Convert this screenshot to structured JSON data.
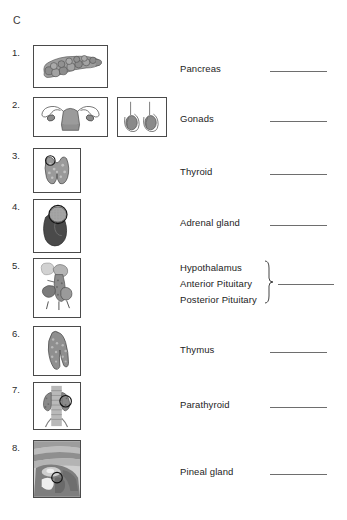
{
  "worksheet": {
    "section_letter": "C",
    "answer_line_color": "#6e6e6e",
    "box_border_color": "#4a4a4a",
    "text_color": "#1d1d1d"
  },
  "rows": [
    {
      "number": "1.",
      "label": "Pancreas",
      "figure": "pancreas-illustration",
      "figures": [
        "pancreas-illustration"
      ]
    },
    {
      "number": "2.",
      "label": "Gonads",
      "figure": "uterus-ovaries-illustration",
      "figures": [
        "uterus-ovaries-illustration",
        "testes-illustration"
      ]
    },
    {
      "number": "3.",
      "label": "Thyroid",
      "figure": "thyroid-gland-illustration",
      "figures": [
        "thyroid-gland-illustration"
      ]
    },
    {
      "number": "4.",
      "label": "Adrenal gland",
      "figure": "kidney-adrenal-illustration",
      "figures": [
        "kidney-adrenal-illustration"
      ]
    },
    {
      "number": "5.",
      "label": "Hypothalamus",
      "label_2": "Anterior Pituitary",
      "label_3": "Posterior Pituitary",
      "grouped": true,
      "figure": "hypothalamus-pituitary-illustration",
      "figures": [
        "hypothalamus-pituitary-illustration"
      ]
    },
    {
      "number": "6.",
      "label": "Thymus",
      "figure": "thymus-illustration",
      "figures": [
        "thymus-illustration"
      ]
    },
    {
      "number": "7.",
      "label": "Parathyroid",
      "figure": "parathyroid-trachea-illustration",
      "figures": [
        "parathyroid-trachea-illustration"
      ]
    },
    {
      "number": "8.",
      "label": "Pineal gland",
      "figure": "brain-sagittal-pineal-illustration",
      "figures": [
        "brain-sagittal-pineal-illustration"
      ]
    }
  ]
}
